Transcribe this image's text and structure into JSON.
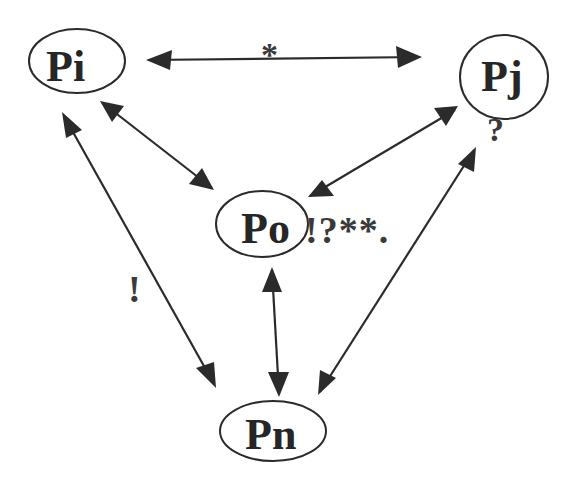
{
  "diagram": {
    "nodes": {
      "pi": {
        "label": "Pi"
      },
      "pj": {
        "label": "Pj"
      },
      "po": {
        "label": "Po"
      },
      "pn": {
        "label": "Pn"
      }
    },
    "annotations": {
      "pi_pj_edge": "*",
      "pj_below": "?",
      "po_suffix": "!?**.",
      "pi_pn_edge": "!"
    },
    "edges": [
      {
        "from": "Pi",
        "to": "Pj",
        "direction": "bidirectional",
        "label": "*"
      },
      {
        "from": "Pi",
        "to": "Po",
        "direction": "bidirectional"
      },
      {
        "from": "Pj",
        "to": "Po",
        "direction": "bidirectional"
      },
      {
        "from": "Pi",
        "to": "Pn",
        "direction": "bidirectional",
        "label": "!"
      },
      {
        "from": "Po",
        "to": "Pn",
        "direction": "bidirectional"
      },
      {
        "from": "Pj",
        "to": "Pn",
        "direction": "bidirectional"
      }
    ],
    "colors": {
      "ink": "#262626",
      "background": "#ffffff"
    }
  }
}
